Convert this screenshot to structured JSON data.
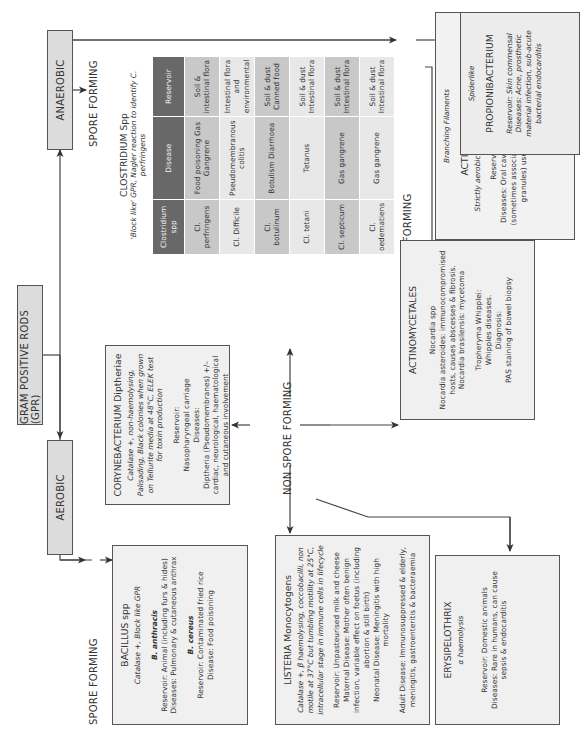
{
  "root": {
    "label": "GRAM POSITIVE RODS (GPR)"
  },
  "anaerobic": {
    "label": "ANAEROBIC",
    "spore_forming_label": "SPORE FORMING",
    "non_spore_forming_label": "NON SPORE FORMING",
    "clostridium": {
      "title": "CLOSTRIDIUM Spp",
      "subtitle": "'Block like' GPR, Nagler reaction to identify C. perfringens",
      "table": {
        "headers": [
          "Clostridium spp",
          "Disease",
          "Reservoir"
        ],
        "rows": [
          [
            "Cl. perfringens",
            "Food poisoning Gas Gangrene",
            "Soil & intestinal flora"
          ],
          [
            "Cl. Difficile",
            "Pseudomembranous colitis",
            "Intestinal flora and environmental"
          ],
          [
            "Cl. botulinum",
            "Botulism Diarrhoea",
            "Soil & dust Canned food"
          ],
          [
            "Cl. tetani",
            "Tetanus",
            "Soil & dust Intestinal flora"
          ],
          [
            "Cl. septicum",
            "Gas gangrene",
            "Soil & dust Intestinal flora"
          ],
          [
            "Cl. oedematiens",
            "Gas gangrene",
            "Soil & dust Intestinal flora"
          ]
        ]
      }
    },
    "actinomyces": {
      "group_label": "Branching Filaments",
      "title": "ACTINOMYCES israelii",
      "subtitle": "Strictly aerobic but best growth anaerobically.",
      "reservoir": "Reservoir: Mouth commensal",
      "diseases": "Diseases: Oral cavity, abdominal & pelvic abscesses (sometimes associated with visible masses of sulphur granules) usually post trauma or surgery."
    },
    "propionibacterium": {
      "group_label": "Spiderlike",
      "title": "PROPIONIBACTERIUM",
      "reservoir": "Reservoir: Skin commensal",
      "diseases": "Diseases: Acne, prosthetic material infection, sub-acute bacterial endocarditis"
    }
  },
  "aerobic": {
    "label": "AEROBIC",
    "spore_forming_label": "SPORE FORMING",
    "non_spore_forming_label": "NON SPORE FORMING",
    "bacillus": {
      "title": "BACILLUS spp",
      "subtitle": "Catalase +, Block like GPR",
      "anthracis": {
        "name": "B. anthracis",
        "reservoir": "Reservoir: Animal (including furs & hides)",
        "diseases": "Diseases: Pulmonary & cutaneous anthrax"
      },
      "cereus": {
        "name": "B. cereus",
        "reservoir": "Reservoir: Contaminated fried rice",
        "disease": "Disease: Food poisoning"
      }
    },
    "corynebacterium": {
      "title": "CORYNEBACTERIUM Diptheriae",
      "subtitle": "Catalase +, non-haemolysing, Palisading, Black colonies when grown on Tellurite media at 48°C, ELEK test for toxin production",
      "reservoir_label": "Reservoir:",
      "reservoir": "Nasopharyngeal carriage",
      "diseases_label": "Diseases:",
      "diseases": "Diptheria (Pseudomembranes) +/– cardiac, neurological, haematological and cutaneous involvement"
    },
    "listeria": {
      "title": "LISTERIA Monocytogens",
      "subtitle": "Catalase +, β haemolysing, coccobacilli, non motile at 37°C but tumbling motility at 25°C, intracellular stage in immune cells in lifecycle",
      "reservoir": "Reservoir: Unpasteurised milk and cheese",
      "maternal": "Maternal Disease: Mother often benign infection, variable effect on foetus (including abortion & still birth)",
      "neonatal": "Neonatal Disease: Meningitis with high mortality",
      "adult": "Adult Disease: Immunosuppressed & elderly, meningitis, gastroenteritis & bacteraemia"
    },
    "erysipelothrix": {
      "title": "ERYSIPELOTHRIX",
      "subtitle": "α haemolysis",
      "reservoir": "Reservoir: Domestic animals",
      "diseases": "Diseases: Rare in humans, can cause sepsis & endocarditis"
    },
    "actinomycetales": {
      "title": "ACTINOMYCETALES",
      "nocardia_title": "Nocardia spp",
      "nocardia_asteroides": "Nocardia asteroides: immunocompromised hosts, causes abscesses & fibrosis.",
      "nocardia_brasilensis": "Nocardia brasilensis: mycetoma",
      "tropheryma_title": "Tropheryma Whipplei:",
      "tropheryma_disease": "Whipples diseases.",
      "diagnosis_label": "Diagnosis:",
      "diagnosis": "PAS staining of bowel biopsy"
    }
  }
}
